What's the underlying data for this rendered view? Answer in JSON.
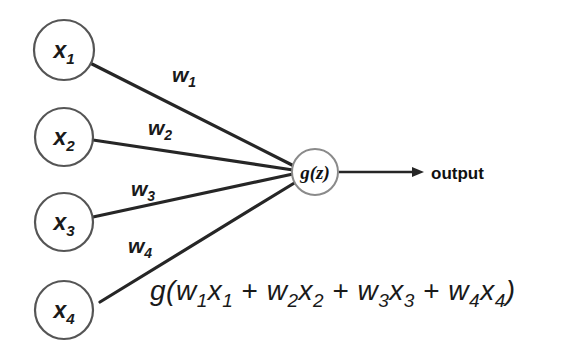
{
  "diagram": {
    "colors": {
      "background": "#ffffff",
      "edge": "#262626",
      "input_node_stroke": "#555555",
      "center_node_stroke": "#8a8a8a",
      "text": "#1a1a1a"
    },
    "input_nodes": [
      {
        "id": "x1",
        "base": "x",
        "sub": "1",
        "cx": 64,
        "cy": 50,
        "r": 30
      },
      {
        "id": "x2",
        "base": "x",
        "sub": "2",
        "cx": 64,
        "cy": 137,
        "r": 29
      },
      {
        "id": "x3",
        "base": "x",
        "sub": "3",
        "cx": 64,
        "cy": 222,
        "r": 29
      },
      {
        "id": "x4",
        "base": "x",
        "sub": "4",
        "cx": 64,
        "cy": 310,
        "r": 29
      }
    ],
    "weights": [
      {
        "id": "w1",
        "base": "w",
        "sub": "1",
        "x": 172,
        "y": 82
      },
      {
        "id": "w2",
        "base": "w",
        "sub": "2",
        "x": 148,
        "y": 135
      },
      {
        "id": "w3",
        "base": "w",
        "sub": "3",
        "x": 131,
        "y": 196
      },
      {
        "id": "w4",
        "base": "w",
        "sub": "4",
        "x": 128,
        "y": 253
      }
    ],
    "center_node": {
      "id": "gz",
      "label": "g(z)",
      "cx": 315,
      "cy": 172,
      "r": 23
    },
    "output": {
      "label": "output",
      "x": 431,
      "y": 179,
      "arrow_from_x": 339,
      "arrow_to_x": 424,
      "arrow_y": 172
    },
    "formula": {
      "text": "g(w1x1 + w2x2 + w3x3 + w4x4)",
      "x": 150,
      "y": 300,
      "tokens": [
        {
          "base": "g(",
          "sub": ""
        },
        {
          "base": "w",
          "sub": "1"
        },
        {
          "base": "x",
          "sub": "1"
        },
        {
          "base": " + ",
          "sub": ""
        },
        {
          "base": "w",
          "sub": "2"
        },
        {
          "base": "x",
          "sub": "2"
        },
        {
          "base": " + ",
          "sub": ""
        },
        {
          "base": "w",
          "sub": "3"
        },
        {
          "base": "x",
          "sub": "3"
        },
        {
          "base": " + ",
          "sub": ""
        },
        {
          "base": "w",
          "sub": "4"
        },
        {
          "base": "x",
          "sub": "4"
        },
        {
          "base": ")",
          "sub": ""
        }
      ]
    }
  }
}
